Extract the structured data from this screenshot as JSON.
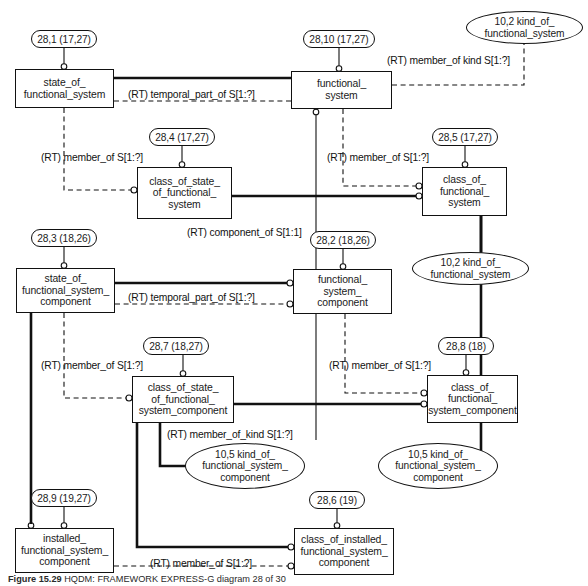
{
  "diagram": {
    "notation": "EXPRESS-G",
    "colors": {
      "line": "#111111",
      "background": "#ffffff",
      "text": "#1a1a1a"
    },
    "entities": [
      {
        "id": "state_of_functional_system",
        "label": "state_of_\nfunctional_system",
        "x": 15,
        "y": 69,
        "w": 99,
        "h": 39
      },
      {
        "id": "functional_system",
        "label": "functional_\nsystem",
        "x": 291,
        "y": 71,
        "w": 101,
        "h": 38
      },
      {
        "id": "class_of_state_of_functional_system",
        "label": "class_of_state_\nof_functional_\nsystem",
        "x": 137,
        "y": 167,
        "w": 95,
        "h": 52
      },
      {
        "id": "class_of_functional_system",
        "label": "class_of_\nfunctional_\nsystem",
        "x": 422,
        "y": 167,
        "w": 85,
        "h": 49
      },
      {
        "id": "state_of_functional_system_component",
        "label": "state_of_\nfunctional_system_\ncomponent",
        "x": 16,
        "y": 268,
        "w": 99,
        "h": 45
      },
      {
        "id": "functional_system_component",
        "label": "functional_\nsystem_\ncomponent",
        "x": 293,
        "y": 269,
        "w": 99,
        "h": 45
      },
      {
        "id": "class_of_state_of_functional_system_component",
        "label": "class_of_state_\nof_functional_\nsystem_component",
        "x": 132,
        "y": 376,
        "w": 102,
        "h": 47
      },
      {
        "id": "class_of_functional_system_component",
        "label": "class_of_\nfunctional_\nsystem_component",
        "x": 427,
        "y": 375,
        "w": 91,
        "h": 48
      },
      {
        "id": "installed_functional_system_component",
        "label": "installed_\nfunctional_system_\ncomponent",
        "x": 15,
        "y": 528,
        "w": 99,
        "h": 45
      },
      {
        "id": "class_of_installed_functional_system_component",
        "label": "class_of_installed_\nfunctional_system_\ncomponent",
        "x": 294,
        "y": 528,
        "w": 100,
        "h": 47
      }
    ],
    "id_pills": [
      {
        "id": "pill-28-1",
        "label": "28,1 (17,27)",
        "x": 31,
        "y": 30,
        "w": 66,
        "h": 18
      },
      {
        "id": "pill-28-10",
        "label": "28,10 (17,27)",
        "x": 303,
        "y": 30,
        "w": 72,
        "h": 18
      },
      {
        "id": "pill-28-4",
        "label": "28,4 (17,27)",
        "x": 149,
        "y": 128,
        "w": 66,
        "h": 18
      },
      {
        "id": "pill-28-5",
        "label": "28,5 (17,27)",
        "x": 432,
        "y": 128,
        "w": 66,
        "h": 18
      },
      {
        "id": "pill-28-3",
        "label": "28,3 (18,26)",
        "x": 31,
        "y": 229,
        "w": 66,
        "h": 18
      },
      {
        "id": "pill-28-2",
        "label": "28,2 (18,26)",
        "x": 310,
        "y": 231,
        "w": 66,
        "h": 18
      },
      {
        "id": "pill-28-7",
        "label": "28,7 (18,27)",
        "x": 143,
        "y": 337,
        "w": 66,
        "h": 18
      },
      {
        "id": "pill-28-8",
        "label": "28,8 (18)",
        "x": 438,
        "y": 337,
        "w": 56,
        "h": 18
      },
      {
        "id": "pill-28-9",
        "label": "28,9 (19,27)",
        "x": 31,
        "y": 489,
        "w": 66,
        "h": 18
      },
      {
        "id": "pill-28-6",
        "label": "28,6 (19)",
        "x": 309,
        "y": 491,
        "w": 56,
        "h": 18
      }
    ],
    "kind_ovals": [
      {
        "id": "oval-10-2-top",
        "label": "10,2 kind_of_\nfunctional_system",
        "x": 466,
        "y": 11,
        "w": 117,
        "h": 33
      },
      {
        "id": "oval-10-2-mid",
        "label": "10,2 kind_of_\nfunctional_system",
        "x": 412,
        "y": 252,
        "w": 117,
        "h": 33
      },
      {
        "id": "oval-10-5-left",
        "label": "10,5 kind_of_\nfunctional_system_\ncomponent",
        "x": 185,
        "y": 443,
        "w": 120,
        "h": 46
      },
      {
        "id": "oval-10-5-right",
        "label": "10,5 kind_of_\nfunctional_system_\ncomponent",
        "x": 378,
        "y": 443,
        "w": 120,
        "h": 46
      }
    ],
    "relationship_labels": [
      {
        "id": "rl-temporal-1",
        "text": "(RT) temporal_part_of S[1:?]",
        "x": 128,
        "y": 89
      },
      {
        "id": "rl-memberkind-1",
        "text": "(RT) member_of kind S[1:?]",
        "x": 387,
        "y": 55
      },
      {
        "id": "rl-member-1",
        "text": "(RT) member_of S[1:?]",
        "x": 41,
        "y": 152
      },
      {
        "id": "rl-member-2",
        "text": "(RT) member_of S[1:?]",
        "x": 327,
        "y": 152
      },
      {
        "id": "rl-component",
        "text": "(RT) component_of S[1:1]",
        "x": 187,
        "y": 227
      },
      {
        "id": "rl-temporal-2",
        "text": "(RT) temporal_part_of S[1:?]",
        "x": 128,
        "y": 292
      },
      {
        "id": "rl-member-3",
        "text": "(RT) member_of S[1:?]",
        "x": 41,
        "y": 360
      },
      {
        "id": "rl-member-4",
        "text": "(RT) member_of S[1:?]",
        "x": 329,
        "y": 360
      },
      {
        "id": "rl-memberkind-2",
        "text": "(RT) member_of_kind S[1:?]",
        "x": 167,
        "y": 429
      },
      {
        "id": "rl-member-5",
        "text": "(RT) member_of S[1:?]",
        "x": 150,
        "y": 558
      }
    ],
    "caption": {
      "figure_number": "Figure",
      "figure_id": "15.29",
      "text": "HQDM: FRAMEWORK EXPRESS-G diagram 28 of 30"
    }
  }
}
